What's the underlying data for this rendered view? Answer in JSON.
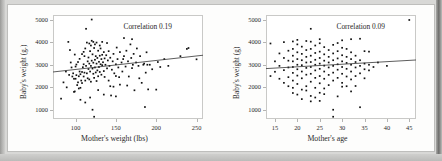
{
  "figure": {
    "background_color": "#d8d8d6",
    "page_color": "#fdfdfc",
    "dot_color": "#111111",
    "line_color": "#333333",
    "frame_color": "#c9c9c7"
  },
  "chart_data": [
    {
      "type": "scatter",
      "title": "",
      "annotation": "Correlation 0.19",
      "correlation": 0.19,
      "xlabel": "Mother's weight (lbs)",
      "ylabel": "Baby's weight (g.)",
      "xlim": [
        72,
        258
      ],
      "ylim": [
        600,
        5200
      ],
      "xticks": [
        100,
        150,
        200,
        250
      ],
      "yticks": [
        1000,
        2000,
        3000,
        4000,
        5000
      ],
      "grid": false,
      "legend": "none",
      "fit_line": {
        "x": [
          72,
          258
        ],
        "y": [
          2680,
          3420
        ]
      },
      "points": [
        [
          85,
          2220
        ],
        [
          82,
          1500
        ],
        [
          89,
          2000
        ],
        [
          91,
          4010
        ],
        [
          93,
          3650
        ],
        [
          95,
          2880
        ],
        [
          96,
          2480
        ],
        [
          97,
          2620
        ],
        [
          98,
          2380
        ],
        [
          99,
          1820
        ],
        [
          100,
          2380
        ],
        [
          100,
          2920
        ],
        [
          101,
          2540
        ],
        [
          102,
          2100
        ],
        [
          103,
          3120
        ],
        [
          104,
          2490
        ],
        [
          104,
          1950
        ],
        [
          105,
          2700
        ],
        [
          105,
          3260
        ],
        [
          106,
          2580
        ],
        [
          107,
          2300
        ],
        [
          108,
          2680
        ],
        [
          108,
          3470
        ],
        [
          109,
          2890
        ],
        [
          110,
          2480
        ],
        [
          110,
          3020
        ],
        [
          110,
          3570
        ],
        [
          111,
          2650
        ],
        [
          112,
          2300
        ],
        [
          112,
          3720
        ],
        [
          113,
          2950
        ],
        [
          113,
          4590
        ],
        [
          114,
          2620
        ],
        [
          115,
          3150
        ],
        [
          115,
          2400
        ],
        [
          116,
          3320
        ],
        [
          116,
          2810
        ],
        [
          117,
          3050
        ],
        [
          117,
          3940
        ],
        [
          118,
          2700
        ],
        [
          118,
          3600
        ],
        [
          119,
          2950
        ],
        [
          119,
          2250
        ],
        [
          120,
          3180
        ],
        [
          120,
          4060
        ],
        [
          120,
          5000
        ],
        [
          121,
          2830
        ],
        [
          121,
          3460
        ],
        [
          122,
          2600
        ],
        [
          122,
          3090
        ],
        [
          123,
          3740
        ],
        [
          123,
          2420
        ],
        [
          124,
          3220
        ],
        [
          124,
          2880
        ],
        [
          125,
          3380
        ],
        [
          125,
          2660
        ],
        [
          126,
          3980
        ],
        [
          126,
          3050
        ],
        [
          127,
          2750
        ],
        [
          127,
          3300
        ],
        [
          128,
          2490
        ],
        [
          128,
          3620
        ],
        [
          129,
          3130
        ],
        [
          129,
          2900
        ],
        [
          130,
          3400
        ],
        [
          130,
          2680
        ],
        [
          130,
          3850
        ],
        [
          131,
          3020
        ],
        [
          132,
          3250
        ],
        [
          132,
          2560
        ],
        [
          133,
          3440
        ],
        [
          133,
          2980
        ],
        [
          134,
          3110
        ],
        [
          135,
          3560
        ],
        [
          135,
          2720
        ],
        [
          136,
          3280
        ],
        [
          137,
          3000
        ],
        [
          138,
          3420
        ],
        [
          139,
          2840
        ],
        [
          140,
          3190
        ],
        [
          141,
          3600
        ],
        [
          142,
          2950
        ],
        [
          143,
          3310
        ],
        [
          145,
          2780
        ],
        [
          146,
          3150
        ],
        [
          147,
          3480
        ],
        [
          148,
          2620
        ],
        [
          150,
          3020
        ],
        [
          150,
          1600
        ],
        [
          152,
          3250
        ],
        [
          153,
          2880
        ],
        [
          155,
          3560
        ],
        [
          155,
          2120
        ],
        [
          157,
          3100
        ],
        [
          158,
          2700
        ],
        [
          160,
          3380
        ],
        [
          160,
          4180
        ],
        [
          162,
          2920
        ],
        [
          163,
          3620
        ],
        [
          165,
          3150
        ],
        [
          166,
          2480
        ],
        [
          168,
          3900
        ],
        [
          169,
          3300
        ],
        [
          170,
          4130
        ],
        [
          170,
          2850
        ],
        [
          172,
          3480
        ],
        [
          173,
          1870
        ],
        [
          175,
          3100
        ],
        [
          176,
          3720
        ],
        [
          178,
          2950
        ],
        [
          180,
          3380
        ],
        [
          182,
          2200
        ],
        [
          185,
          3050
        ],
        [
          186,
          1130
        ],
        [
          187,
          2650
        ],
        [
          188,
          3550
        ],
        [
          190,
          1910
        ],
        [
          192,
          3000
        ],
        [
          195,
          2800
        ],
        [
          200,
          1900
        ],
        [
          202,
          3120
        ],
        [
          205,
          2900
        ],
        [
          210,
          3250
        ],
        [
          215,
          2950
        ],
        [
          230,
          3380
        ],
        [
          238,
          3700
        ],
        [
          240,
          3740
        ],
        [
          250,
          3240
        ],
        [
          88,
          2700
        ],
        [
          92,
          2550
        ],
        [
          94,
          3100
        ],
        [
          99,
          3450
        ],
        [
          101,
          3010
        ],
        [
          103,
          2220
        ],
        [
          106,
          1980
        ],
        [
          108,
          2190
        ],
        [
          111,
          3380
        ],
        [
          114,
          3980
        ],
        [
          117,
          2350
        ],
        [
          119,
          3850
        ],
        [
          122,
          4010
        ],
        [
          124,
          3900
        ],
        [
          126,
          2280
        ],
        [
          128,
          1880
        ],
        [
          131,
          3720
        ],
        [
          133,
          4010
        ],
        [
          136,
          2460
        ],
        [
          139,
          3960
        ],
        [
          141,
          2300
        ],
        [
          144,
          1640
        ],
        [
          147,
          2030
        ],
        [
          151,
          3760
        ],
        [
          154,
          2450
        ],
        [
          159,
          3250
        ],
        [
          164,
          2080
        ],
        [
          171,
          3000
        ],
        [
          179,
          2400
        ],
        [
          184,
          3000
        ],
        [
          189,
          3000
        ],
        [
          121,
          1010
        ],
        [
          123,
          700
        ],
        [
          118,
          1550
        ],
        [
          112,
          1330
        ],
        [
          106,
          1450
        ],
        [
          98,
          1800
        ],
        [
          135,
          1680
        ],
        [
          143,
          2050
        ],
        [
          150,
          2500
        ]
      ]
    },
    {
      "type": "scatter",
      "title": "",
      "annotation": "Correlation 0.09",
      "correlation": 0.09,
      "xlabel": "Mother's age",
      "ylabel": "Baby's weight (g)",
      "xlim": [
        13,
        46.5
      ],
      "ylim": [
        600,
        5200
      ],
      "xticks": [
        15,
        20,
        25,
        30,
        35,
        40,
        45
      ],
      "yticks": [
        1000,
        2000,
        3000,
        4000,
        5000
      ],
      "grid": false,
      "legend": "none",
      "fit_line": {
        "x": [
          13,
          46.5
        ],
        "y": [
          2830,
          3210
        ]
      },
      "points": [
        [
          14,
          3940
        ],
        [
          14,
          2500
        ],
        [
          15,
          2690
        ],
        [
          15,
          3150
        ],
        [
          16,
          2380
        ],
        [
          16,
          3500
        ],
        [
          16,
          2950
        ],
        [
          17,
          2200
        ],
        [
          17,
          2760
        ],
        [
          17,
          3300
        ],
        [
          17,
          4000
        ],
        [
          18,
          2450
        ],
        [
          18,
          2880
        ],
        [
          18,
          3180
        ],
        [
          18,
          3620
        ],
        [
          18,
          2050
        ],
        [
          19,
          2300
        ],
        [
          19,
          2640
        ],
        [
          19,
          2900
        ],
        [
          19,
          3150
        ],
        [
          19,
          3400
        ],
        [
          19,
          3700
        ],
        [
          19,
          4030
        ],
        [
          19,
          1980
        ],
        [
          20,
          2150
        ],
        [
          20,
          2520
        ],
        [
          20,
          2800
        ],
        [
          20,
          3000
        ],
        [
          20,
          3250
        ],
        [
          20,
          3550
        ],
        [
          20,
          3900
        ],
        [
          20,
          4100
        ],
        [
          21,
          1900
        ],
        [
          21,
          2400
        ],
        [
          21,
          2700
        ],
        [
          21,
          2980
        ],
        [
          21,
          3200
        ],
        [
          21,
          3480
        ],
        [
          21,
          3800
        ],
        [
          22,
          2050
        ],
        [
          22,
          2560
        ],
        [
          22,
          2860
        ],
        [
          22,
          3100
        ],
        [
          22,
          3350
        ],
        [
          22,
          3650
        ],
        [
          22,
          4050
        ],
        [
          23,
          1620
        ],
        [
          23,
          2250
        ],
        [
          23,
          2600
        ],
        [
          23,
          2900
        ],
        [
          23,
          3120
        ],
        [
          23,
          3400
        ],
        [
          23,
          3700
        ],
        [
          23,
          4020
        ],
        [
          23,
          4590
        ],
        [
          24,
          1980
        ],
        [
          24,
          2420
        ],
        [
          24,
          2750
        ],
        [
          24,
          3000
        ],
        [
          24,
          3220
        ],
        [
          24,
          3520
        ],
        [
          24,
          3850
        ],
        [
          25,
          1400
        ],
        [
          25,
          1760
        ],
        [
          25,
          2180
        ],
        [
          25,
          2500
        ],
        [
          25,
          2820
        ],
        [
          25,
          3050
        ],
        [
          25,
          3300
        ],
        [
          25,
          3580
        ],
        [
          25,
          3950
        ],
        [
          25,
          4130
        ],
        [
          26,
          1950
        ],
        [
          26,
          2380
        ],
        [
          26,
          2700
        ],
        [
          26,
          2960
        ],
        [
          26,
          3180
        ],
        [
          26,
          3460
        ],
        [
          26,
          3780
        ],
        [
          27,
          2100
        ],
        [
          27,
          2550
        ],
        [
          27,
          2880
        ],
        [
          27,
          3100
        ],
        [
          27,
          3350
        ],
        [
          27,
          3650
        ],
        [
          28,
          700
        ],
        [
          28,
          1010
        ],
        [
          28,
          2300
        ],
        [
          28,
          2650
        ],
        [
          28,
          2950
        ],
        [
          28,
          3200
        ],
        [
          28,
          3500
        ],
        [
          28,
          3880
        ],
        [
          29,
          1600
        ],
        [
          29,
          2420
        ],
        [
          29,
          2780
        ],
        [
          29,
          3020
        ],
        [
          29,
          3280
        ],
        [
          29,
          3600
        ],
        [
          29,
          3960
        ],
        [
          30,
          2200
        ],
        [
          30,
          2600
        ],
        [
          30,
          2900
        ],
        [
          30,
          3150
        ],
        [
          30,
          3420
        ],
        [
          30,
          3750
        ],
        [
          30,
          4080
        ],
        [
          31,
          2050
        ],
        [
          31,
          2480
        ],
        [
          31,
          2820
        ],
        [
          31,
          3080
        ],
        [
          31,
          3350
        ],
        [
          31,
          3700
        ],
        [
          32,
          1820
        ],
        [
          32,
          2350
        ],
        [
          32,
          2700
        ],
        [
          32,
          3000
        ],
        [
          32,
          3250
        ],
        [
          32,
          3550
        ],
        [
          32,
          4130
        ],
        [
          33,
          2500
        ],
        [
          33,
          2880
        ],
        [
          33,
          3120
        ],
        [
          33,
          3400
        ],
        [
          33,
          2060
        ],
        [
          34,
          1120
        ],
        [
          34,
          2620
        ],
        [
          34,
          2950
        ],
        [
          34,
          3200
        ],
        [
          34,
          4150
        ],
        [
          35,
          2400
        ],
        [
          35,
          2800
        ],
        [
          35,
          3050
        ],
        [
          35,
          3600
        ],
        [
          36,
          2750
        ],
        [
          36,
          3000
        ],
        [
          36,
          3580
        ],
        [
          37,
          2900
        ],
        [
          38,
          3100
        ],
        [
          40,
          2950
        ],
        [
          45,
          4980
        ],
        [
          21,
          1480
        ],
        [
          23,
          1380
        ],
        [
          24,
          1550
        ],
        [
          26,
          1700
        ],
        [
          30,
          2030
        ],
        [
          19,
          1750
        ],
        [
          20,
          1680
        ],
        [
          22,
          1860
        ]
      ]
    }
  ]
}
